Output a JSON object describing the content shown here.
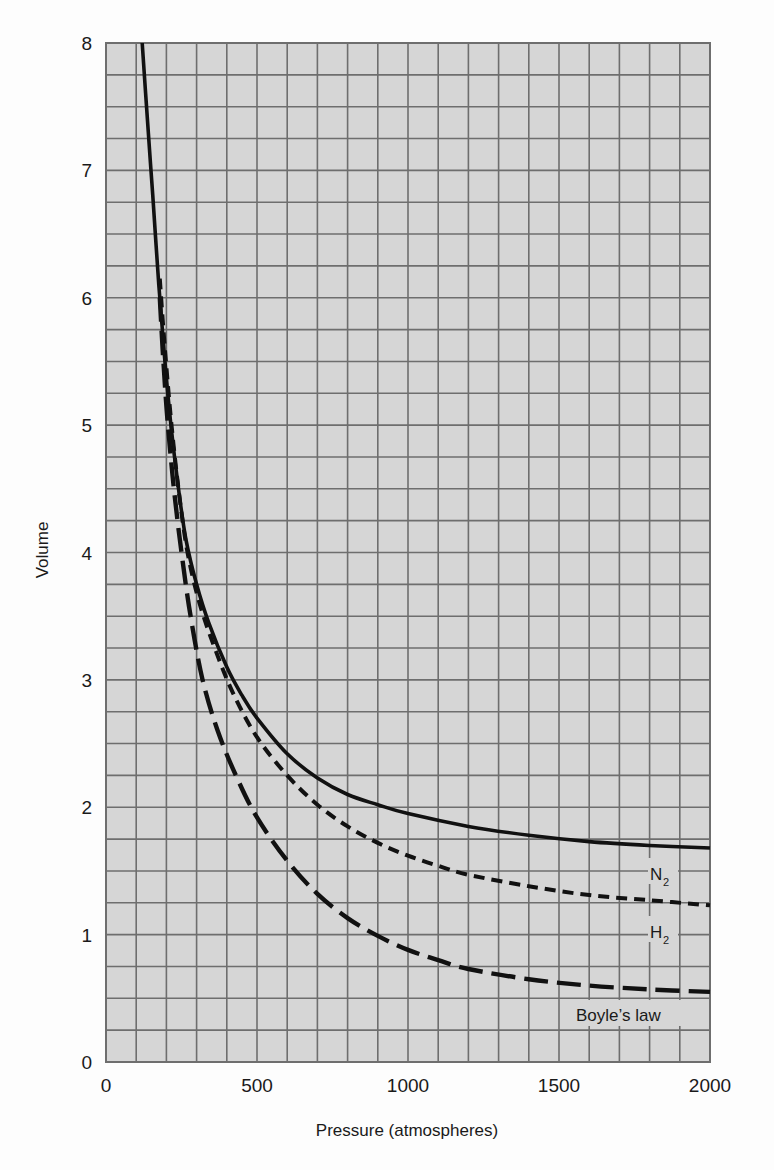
{
  "chart_data": {
    "type": "line",
    "title": "",
    "xlabel": "Pressure (atmospheres)",
    "ylabel": "Volume",
    "xlim": [
      0,
      2000
    ],
    "ylim": [
      0,
      8
    ],
    "x_ticks": [
      0,
      500,
      1000,
      1500,
      2000
    ],
    "y_ticks": [
      0,
      1,
      2,
      3,
      4,
      5,
      6,
      7,
      8
    ],
    "grid": {
      "on": true,
      "x_step": 100,
      "y_step": 0.25
    },
    "legend": "inline labels near right end of curves",
    "series": [
      {
        "name": "N2",
        "label": "N",
        "subscript": "2",
        "style": "solid",
        "points": [
          [
            120,
            8
          ],
          [
            140,
            7.3
          ],
          [
            155,
            6.8
          ],
          [
            175,
            6.1
          ],
          [
            195,
            5.5
          ],
          [
            215,
            5.0
          ],
          [
            240,
            4.5
          ],
          [
            265,
            4.1
          ],
          [
            300,
            3.75
          ],
          [
            340,
            3.45
          ],
          [
            400,
            3.1
          ],
          [
            450,
            2.88
          ],
          [
            500,
            2.7
          ],
          [
            600,
            2.42
          ],
          [
            700,
            2.23
          ],
          [
            800,
            2.1
          ],
          [
            900,
            2.02
          ],
          [
            1000,
            1.95
          ],
          [
            1200,
            1.85
          ],
          [
            1400,
            1.78
          ],
          [
            1600,
            1.73
          ],
          [
            1800,
            1.7
          ],
          [
            2000,
            1.68
          ]
        ]
      },
      {
        "name": "H2",
        "label": "H",
        "subscript": "2",
        "style": "short-dash",
        "points": [
          [
            178,
            6.15
          ],
          [
            195,
            5.6
          ],
          [
            215,
            5.05
          ],
          [
            240,
            4.5
          ],
          [
            270,
            4.0
          ],
          [
            310,
            3.6
          ],
          [
            360,
            3.25
          ],
          [
            420,
            2.9
          ],
          [
            500,
            2.55
          ],
          [
            600,
            2.25
          ],
          [
            700,
            2.02
          ],
          [
            800,
            1.85
          ],
          [
            900,
            1.72
          ],
          [
            1000,
            1.62
          ],
          [
            1100,
            1.54
          ],
          [
            1200,
            1.47
          ],
          [
            1400,
            1.38
          ],
          [
            1600,
            1.31
          ],
          [
            1800,
            1.27
          ],
          [
            2000,
            1.23
          ]
        ]
      },
      {
        "name": "Boyle's law",
        "label": "Boyle’s law",
        "style": "long-dash",
        "points": [
          [
            178,
            6.0
          ],
          [
            190,
            5.5
          ],
          [
            205,
            5.0
          ],
          [
            225,
            4.5
          ],
          [
            250,
            4.0
          ],
          [
            280,
            3.5
          ],
          [
            320,
            3.0
          ],
          [
            370,
            2.6
          ],
          [
            430,
            2.25
          ],
          [
            500,
            1.92
          ],
          [
            600,
            1.58
          ],
          [
            700,
            1.32
          ],
          [
            800,
            1.13
          ],
          [
            900,
            0.99
          ],
          [
            1000,
            0.88
          ],
          [
            1100,
            0.8
          ],
          [
            1200,
            0.73
          ],
          [
            1400,
            0.65
          ],
          [
            1600,
            0.6
          ],
          [
            1800,
            0.57
          ],
          [
            2000,
            0.55
          ]
        ]
      }
    ]
  },
  "axes": {
    "x_title": "Pressure (atmospheres)",
    "y_title": "Volume"
  },
  "labels": {
    "n2_main": "N",
    "n2_sub": "2",
    "h2_main": "H",
    "h2_sub": "2",
    "boyle": "Boyle’s law"
  },
  "colors": {
    "grid_bg": "#d6d6d6",
    "grid_line": "#6e6e6e",
    "curve": "#111111",
    "text": "#1a1a1a"
  }
}
